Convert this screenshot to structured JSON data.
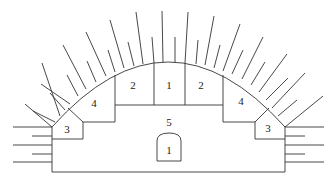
{
  "diagram": {
    "type": "tunnel-excavation-sequence",
    "regions": [
      {
        "id": "center-top",
        "label": "1",
        "x": 169,
        "y": 86
      },
      {
        "id": "left-upper",
        "label": "2",
        "x": 133,
        "y": 88
      },
      {
        "id": "right-upper",
        "label": "2",
        "x": 201,
        "y": 88
      },
      {
        "id": "left-haunch",
        "label": "4",
        "x": 94,
        "y": 106
      },
      {
        "id": "right-haunch",
        "label": "4",
        "x": 241,
        "y": 104
      },
      {
        "id": "left-wall",
        "label": "3",
        "x": 67,
        "y": 132
      },
      {
        "id": "right-wall",
        "label": "3",
        "x": 268,
        "y": 131
      },
      {
        "id": "core",
        "label": "5",
        "x": 169,
        "y": 125
      },
      {
        "id": "pilot-tunnel",
        "label": "1",
        "x": 169,
        "y": 153
      }
    ]
  }
}
